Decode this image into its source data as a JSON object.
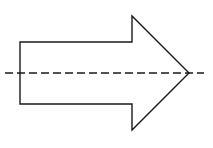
{
  "diagram": {
    "background": "#ffffff",
    "stroke_color": "#1a1a1a",
    "arrow": {
      "direction": "right",
      "points": "20,42 132,42 132,16 189,73 132,130 132,104 20,104"
    },
    "axis_line": {
      "style": "dashed",
      "x1": 5,
      "x2": 204,
      "y": 73
    }
  }
}
